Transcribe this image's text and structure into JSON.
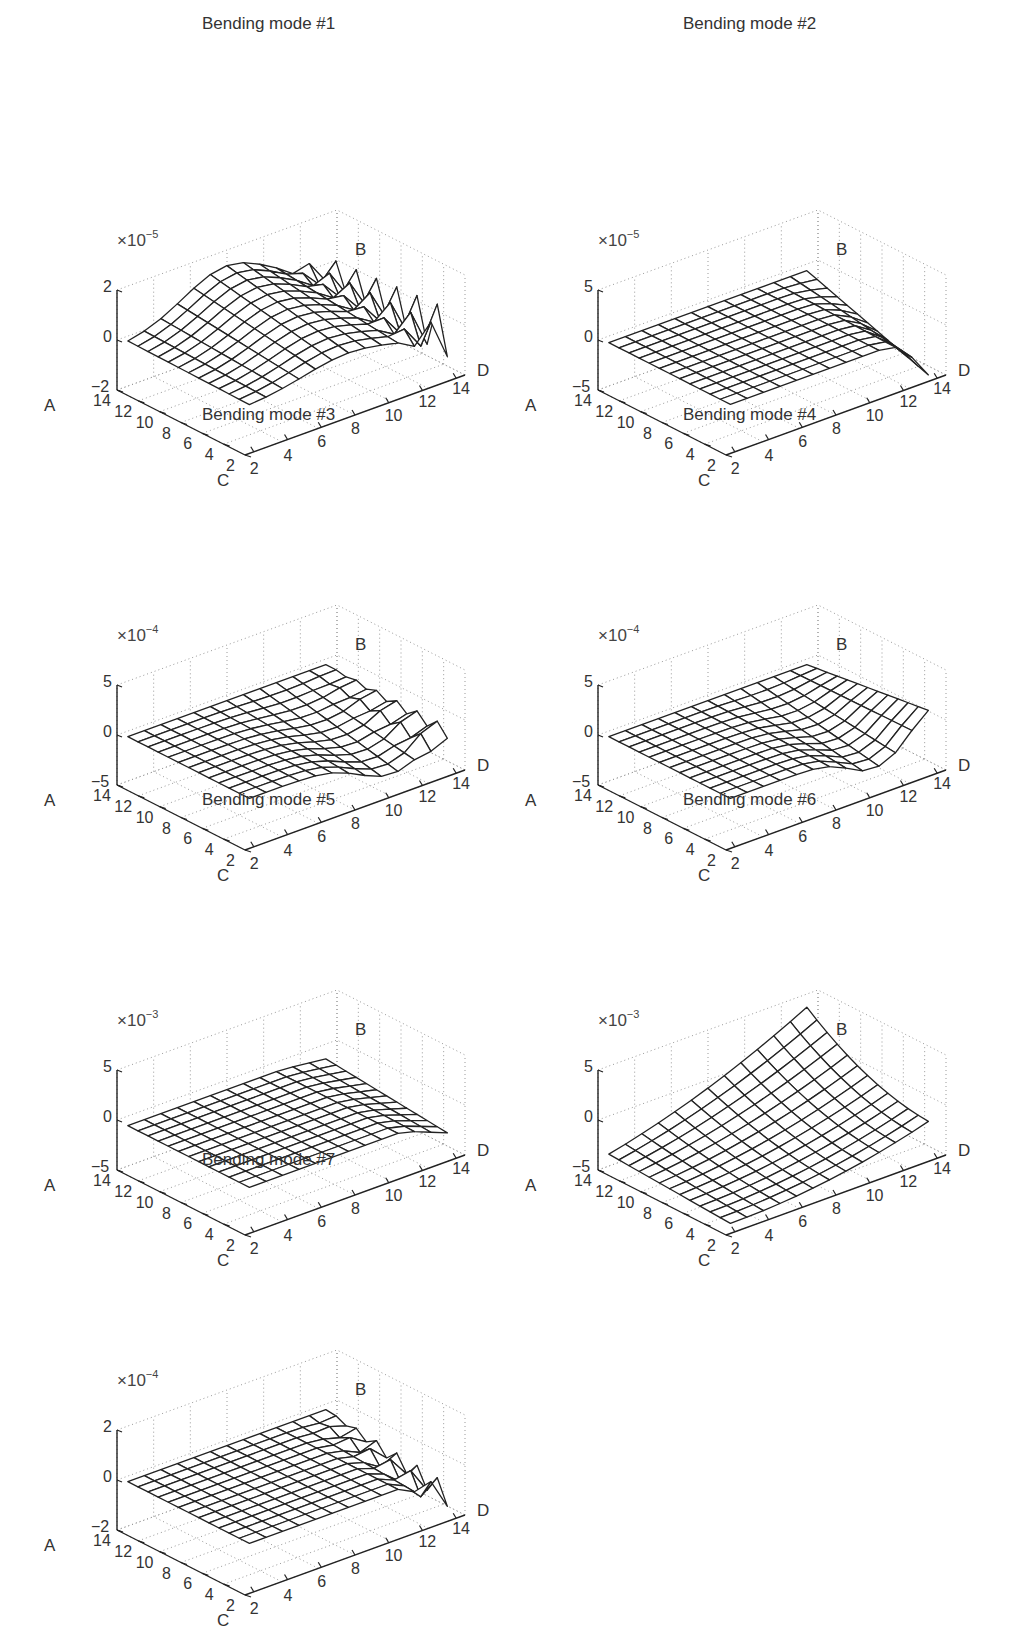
{
  "figure": {
    "background": "#ffffff",
    "line_color": "#222222",
    "grid_color": "#999999"
  },
  "chart_data": [
    {
      "type": "surface",
      "title": "Bending mode #1",
      "z_multiplier": "×10",
      "z_exponent": "−5",
      "axis_labels": {
        "a": "A",
        "b": "B",
        "c": "C",
        "d": "D"
      },
      "z_ticks": [
        "2",
        "0",
        "−2"
      ],
      "zlim": [
        -2,
        2
      ],
      "a_ticks": [
        "14",
        "12",
        "10",
        "8",
        "6",
        "4",
        "2"
      ],
      "d_ticks": [
        "2",
        "4",
        "6",
        "8",
        "10",
        "12",
        "14"
      ],
      "grid_size": [
        13,
        13
      ],
      "shape": "mode1",
      "description": "Broad positive hump rising to ~+1.8 at center-back; strong jagged oscillations near D=12–14 edge reaching about ±1.5"
    },
    {
      "type": "surface",
      "title": "Bending mode #2",
      "z_multiplier": "×10",
      "z_exponent": "−5",
      "axis_labels": {
        "a": "A",
        "b": "B",
        "c": "C",
        "d": "D"
      },
      "z_ticks": [
        "5",
        "0",
        "−5"
      ],
      "zlim": [
        -5,
        5
      ],
      "a_ticks": [
        "14",
        "12",
        "10",
        "8",
        "6",
        "4",
        "2"
      ],
      "d_ticks": [
        "2",
        "4",
        "6",
        "8",
        "10",
        "12",
        "14"
      ],
      "grid_size": [
        13,
        13
      ],
      "shape": "mode2",
      "description": "Nearly flat plane at ~0; sharp drop to about −4.5 along the D=13–14 edge near low A"
    },
    {
      "type": "surface",
      "title": "Bending mode #3",
      "z_multiplier": "×10",
      "z_exponent": "−4",
      "axis_labels": {
        "a": "A",
        "b": "B",
        "c": "C",
        "d": "D"
      },
      "z_ticks": [
        "5",
        "0",
        "−5"
      ],
      "zlim": [
        -5,
        5
      ],
      "a_ticks": [
        "14",
        "12",
        "10",
        "8",
        "6",
        "4",
        "2"
      ],
      "d_ticks": [
        "2",
        "4",
        "6",
        "8",
        "10",
        "12",
        "14"
      ],
      "grid_size": [
        13,
        13
      ],
      "shape": "mode3",
      "description": "Flat at 0 with a trough of about −3 near D=8–12, small ripples at D=14 edge"
    },
    {
      "type": "surface",
      "title": "Bending mode #4",
      "z_multiplier": "×10",
      "z_exponent": "−4",
      "axis_labels": {
        "a": "A",
        "b": "B",
        "c": "C",
        "d": "D"
      },
      "z_ticks": [
        "5",
        "0",
        "−5"
      ],
      "zlim": [
        -5,
        5
      ],
      "a_ticks": [
        "14",
        "12",
        "10",
        "8",
        "6",
        "4",
        "2"
      ],
      "d_ticks": [
        "2",
        "4",
        "6",
        "8",
        "10",
        "12",
        "14"
      ],
      "grid_size": [
        13,
        13
      ],
      "shape": "mode4",
      "description": "Flat at 0; near D=10–14 the surface dips to about −3 then rises at the corner"
    },
    {
      "type": "surface",
      "title": "Bending mode #5",
      "z_multiplier": "×10",
      "z_exponent": "−3",
      "axis_labels": {
        "a": "A",
        "b": "B",
        "c": "C",
        "d": "D"
      },
      "z_ticks": [
        "5",
        "0",
        "−5"
      ],
      "zlim": [
        -5,
        5
      ],
      "a_ticks": [
        "14",
        "12",
        "10",
        "8",
        "6",
        "4",
        "2"
      ],
      "d_ticks": [
        "2",
        "4",
        "6",
        "8",
        "10",
        "12",
        "14"
      ],
      "grid_size": [
        13,
        13
      ],
      "shape": "mode5",
      "description": "Flat at about −0.5; downward fold of ~−2 along D=12–14 edge"
    },
    {
      "type": "surface",
      "title": "Bending mode #6",
      "z_multiplier": "×10",
      "z_exponent": "−3",
      "axis_labels": {
        "a": "A",
        "b": "B",
        "c": "C",
        "d": "D"
      },
      "z_ticks": [
        "5",
        "0",
        "−5"
      ],
      "zlim": [
        -5,
        5
      ],
      "a_ticks": [
        "14",
        "12",
        "10",
        "8",
        "6",
        "4",
        "2"
      ],
      "d_ticks": [
        "2",
        "4",
        "6",
        "8",
        "10",
        "12",
        "14"
      ],
      "grid_size": [
        13,
        13
      ],
      "shape": "mode6",
      "description": "Saddle-like bowl: about −4 along C/A edges, rising to about +2.5 at the back corner (high A, high D)"
    },
    {
      "type": "surface",
      "title": "Bending mode #7",
      "z_multiplier": "×10",
      "z_exponent": "−4",
      "axis_labels": {
        "a": "A",
        "b": "B",
        "c": "C",
        "d": "D"
      },
      "z_ticks": [
        "2",
        "0",
        "−2"
      ],
      "zlim": [
        -2,
        2
      ],
      "a_ticks": [
        "14",
        "12",
        "10",
        "8",
        "6",
        "4",
        "2"
      ],
      "d_ticks": [
        "2",
        "4",
        "6",
        "8",
        "10",
        "12",
        "14"
      ],
      "grid_size": [
        13,
        13
      ],
      "shape": "mode7",
      "description": "Flat at 0; slight dip and triangular ripples of about ±1 near D=12–14"
    }
  ],
  "panels": [
    {
      "left": 30,
      "top": 0
    },
    {
      "left": 511,
      "top": 0
    },
    {
      "left": 30,
      "top": 395
    },
    {
      "left": 511,
      "top": 395
    },
    {
      "left": 30,
      "top": 780
    },
    {
      "left": 511,
      "top": 780
    },
    {
      "left": 30,
      "top": 1140
    }
  ]
}
